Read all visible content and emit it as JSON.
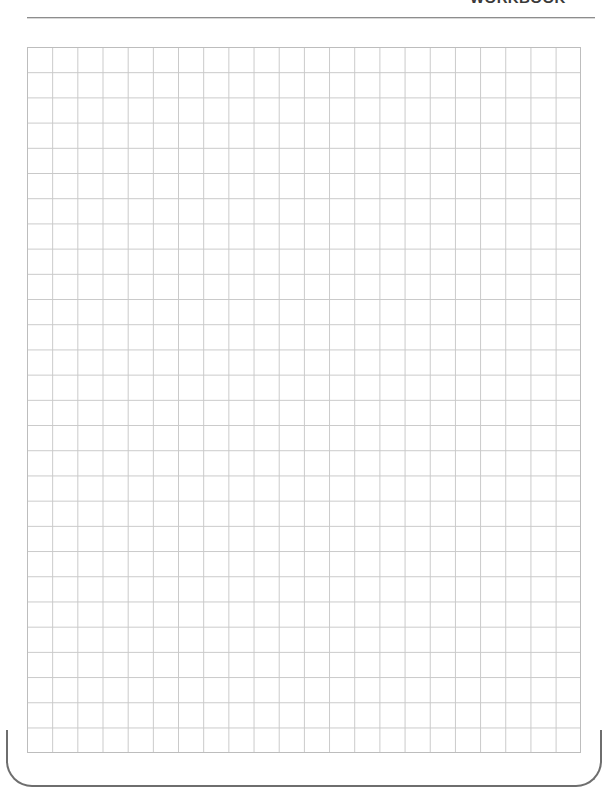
{
  "page": {
    "width": 614,
    "height": 798,
    "background_color": "#ffffff",
    "border_color": "#6e6e6e",
    "corner_radius_px": 26
  },
  "header": {
    "title": "WORKBOOK",
    "title_color": "#3a3a3a",
    "title_cropped": "true",
    "rule_color": "#8d8d8d"
  },
  "grid": {
    "label": "graph-paper-grid",
    "columns": 22,
    "rows": 28,
    "cell_width_px": 25.18,
    "cell_height_px": 25.21,
    "line_color": "#c9c9c9",
    "outline_color": "#bdbdbd",
    "left_px": 27,
    "top_px": 47,
    "width_px": 554,
    "height_px": 706
  }
}
